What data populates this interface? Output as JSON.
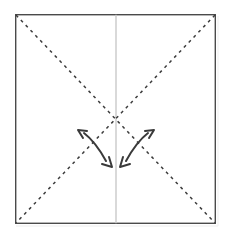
{
  "diagram": {
    "title": "Origami fold diagram - square with diagonal valley folds",
    "type": "origami-step",
    "canvas": {
      "width": 231,
      "height": 239,
      "background": "#ffffff"
    },
    "paper": {
      "name": "square-sheet",
      "x": 15,
      "y": 14,
      "width": 201,
      "height": 210,
      "fill": "#ffffff",
      "stroke": "#4a4a4a",
      "stroke_width": 1.4
    },
    "center_line": {
      "name": "vertical-center-crease",
      "label": "existing vertical crease",
      "x": 116,
      "y1": 14,
      "y2": 224,
      "stroke": "#c9c9c9",
      "stroke_width": 1.4,
      "style": "solid"
    },
    "fold_lines": [
      {
        "name": "diagonal-fold-tl-br",
        "label": "diagonal fold top-left to bottom-right",
        "x1": 16,
        "y1": 15,
        "x2": 215,
        "y2": 223,
        "stroke": "#3c3c3c",
        "stroke_width": 1.5,
        "dash": "3 4",
        "style": "dashed"
      },
      {
        "name": "diagonal-fold-tr-bl",
        "label": "diagonal fold top-right to bottom-left",
        "x1": 215,
        "y1": 15,
        "x2": 16,
        "y2": 223,
        "stroke": "#3c3c3c",
        "stroke_width": 1.5,
        "dash": "3 4",
        "style": "dashed"
      }
    ],
    "arrows": [
      {
        "name": "fold-arrow-left",
        "label": "left double-headed fold arrow",
        "path": "M 84 133 C 93 140 100 150 106 161",
        "head_start": {
          "x": 84,
          "y": 133,
          "angle": -140
        },
        "head_end": {
          "x": 106,
          "y": 161,
          "angle": 62
        },
        "stroke": "#3a3a3a",
        "stroke_width": 2.0
      },
      {
        "name": "fold-arrow-right",
        "label": "right double-headed fold arrow",
        "path": "M 148 133 C 139 140 132 150 126 161",
        "head_start": {
          "x": 148,
          "y": 133,
          "angle": -40
        },
        "head_end": {
          "x": 126,
          "y": 161,
          "angle": 118
        },
        "stroke": "#3a3a3a",
        "stroke_width": 2.0
      }
    ],
    "shadow": {
      "name": "bottom-edge-shadow",
      "x1": 16,
      "x2": 218,
      "y": 226,
      "stroke": "#ededed",
      "stroke_width": 1.2
    }
  }
}
